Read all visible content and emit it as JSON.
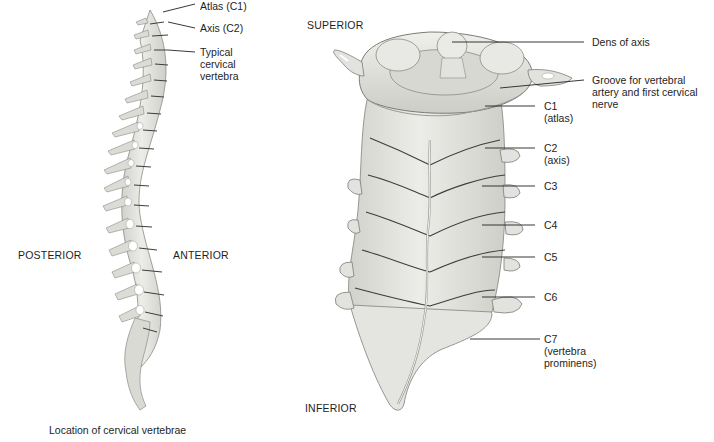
{
  "figure": {
    "caption": "Location of cervical vertebrae",
    "orientation": {
      "superior": "SUPERIOR",
      "inferior": "INFERIOR",
      "posterior": "POSTERIOR",
      "anterior": "ANTERIOR"
    },
    "spine_view": {
      "labels": [
        {
          "id": "atlas",
          "text": "Atlas (C1)"
        },
        {
          "id": "axis",
          "text": "Axis (C2)"
        },
        {
          "id": "typical",
          "line1": "Typical",
          "line2": "cervical",
          "line3": "vertebra"
        }
      ]
    },
    "cervical_view": {
      "labels": [
        {
          "id": "dens",
          "text": "Dens of axis"
        },
        {
          "id": "groove",
          "line1": "Groove for vertebral",
          "line2": "artery and first cervical",
          "line3": "nerve"
        },
        {
          "id": "c1",
          "line1": "C1",
          "line2": "(atlas)"
        },
        {
          "id": "c2",
          "line1": "C2",
          "line2": "(axis)"
        },
        {
          "id": "c3",
          "text": "C3"
        },
        {
          "id": "c4",
          "text": "C4"
        },
        {
          "id": "c5",
          "text": "C5"
        },
        {
          "id": "c6",
          "text": "C6"
        },
        {
          "id": "c7",
          "line1": "C7",
          "line2": "(vertebra",
          "line3": "prominens)"
        }
      ]
    },
    "colors": {
      "bone_fill": "#e6e6e2",
      "bone_shade": "#c9c9c4",
      "bone_outline": "#6e6e6a",
      "leader_line": "#222222",
      "text": "#1e1e1e"
    }
  }
}
